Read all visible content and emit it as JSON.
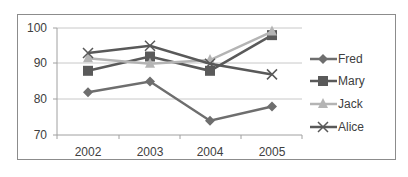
{
  "chart_data": {
    "type": "line",
    "title": "",
    "xlabel": "",
    "ylabel": "",
    "categories": [
      "2002",
      "2003",
      "2004",
      "2005"
    ],
    "ylim": [
      70,
      100
    ],
    "yticks": [
      70,
      80,
      90,
      100
    ],
    "grid": true,
    "legend_position": "right",
    "series": [
      {
        "name": "Fred",
        "marker": "diamond",
        "color": "#6e6e6e",
        "values": [
          82,
          85,
          74,
          78
        ]
      },
      {
        "name": "Mary",
        "marker": "square",
        "color": "#5a5a5a",
        "values": [
          88,
          92,
          88,
          98
        ]
      },
      {
        "name": "Jack",
        "marker": "triangle",
        "color": "#b4b4b4",
        "values": [
          91.5,
          90,
          91,
          99
        ]
      },
      {
        "name": "Alice",
        "marker": "x",
        "color": "#595959",
        "values": [
          93,
          95,
          90,
          87
        ]
      }
    ]
  },
  "axis": {
    "y_labels": [
      "100",
      "90",
      "80",
      "70"
    ],
    "x_labels": [
      "2002",
      "2003",
      "2004",
      "2005"
    ]
  },
  "legend": {
    "items": [
      "Fred",
      "Mary",
      "Jack",
      "Alice"
    ]
  }
}
